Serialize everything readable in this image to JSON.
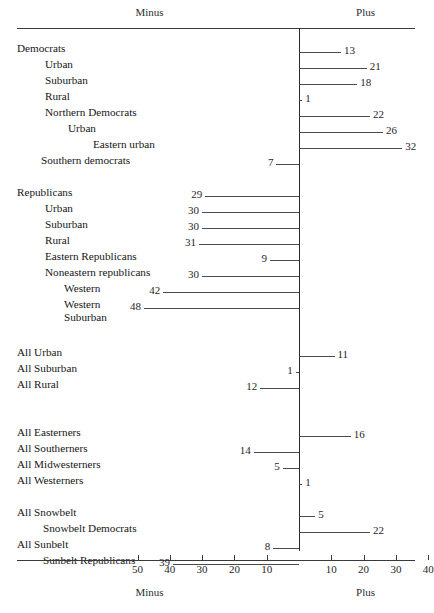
{
  "header": {
    "minus": "Minus",
    "plus": "Plus"
  },
  "footer": {
    "minus": "Minus",
    "plus": "Plus"
  },
  "axis": {
    "zero_px": 299,
    "px_per_unit": 3.23,
    "row_top": 42,
    "row_step": 16,
    "ticks_left": [
      "50",
      "40",
      "30",
      "20",
      "10"
    ],
    "ticks_right": [
      "10",
      "20",
      "30",
      "40"
    ],
    "tick_values_left": [
      50,
      40,
      30,
      20,
      10
    ],
    "tick_values_right": [
      10,
      20,
      30,
      40
    ]
  },
  "chart_data": {
    "type": "bar",
    "orientation": "horizontal-diverging",
    "title": "",
    "xlabel": "Minus / Plus",
    "ylabel": "",
    "xlim": [
      -55,
      45
    ],
    "grid": false,
    "legend": "none",
    "axis_top_label_left": "Minus",
    "axis_top_label_right": "Plus",
    "axis_bottom_label_left": "Minus",
    "axis_bottom_label_right": "Plus",
    "tick_labels": [
      "50",
      "40",
      "30",
      "20",
      "10",
      "10",
      "20",
      "30",
      "40"
    ],
    "categories": [
      "Democrats",
      "Urban",
      "Suburban",
      "Rural",
      "Northern Democrats",
      "Urban",
      "Eastern urban",
      "Southern democrats",
      "Republicans",
      "Urban",
      "Suburban",
      "Rural",
      "Eastern Republicans",
      "Noneastern republicans",
      "Western",
      "Western Suburban",
      "All Urban",
      "All Suburban",
      "All Rural",
      "All Easterners",
      "All Southerners",
      "All Midwesterners",
      "All Westerners",
      "All Snowbelt",
      "Snowbelt Democrats",
      "All Sunbelt",
      "Sunbelt Republicans"
    ],
    "values": [
      13,
      21,
      18,
      1,
      22,
      26,
      32,
      -7,
      -29,
      -30,
      -30,
      -31,
      -9,
      -30,
      -42,
      -48,
      11,
      -1,
      -12,
      16,
      -14,
      -5,
      1,
      5,
      22,
      -8,
      -39
    ]
  },
  "rows": [
    {
      "label": "Democrats",
      "indent": 17,
      "value": 13,
      "display": "13",
      "slot": 0
    },
    {
      "label": "Urban",
      "indent": 45,
      "value": 21,
      "display": "21",
      "slot": 1
    },
    {
      "label": "Suburban",
      "indent": 45,
      "value": 18,
      "display": "18",
      "slot": 2
    },
    {
      "label": "Rural",
      "indent": 45,
      "value": 1,
      "display": "1",
      "slot": 3
    },
    {
      "label": "Northern Democrats",
      "indent": 45,
      "value": 22,
      "display": "22",
      "slot": 4
    },
    {
      "label": "Urban",
      "indent": 68,
      "value": 26,
      "display": "26",
      "slot": 5
    },
    {
      "label": "Eastern urban",
      "indent": 93,
      "value": 32,
      "display": "32",
      "slot": 6
    },
    {
      "label": "Southern democrats",
      "indent": 41,
      "value": -7,
      "display": "7",
      "slot": 7
    },
    {
      "label": "Republicans",
      "indent": 17,
      "value": -29,
      "display": "29",
      "slot": 9
    },
    {
      "label": "Urban",
      "indent": 45,
      "value": -30,
      "display": "30",
      "slot": 10
    },
    {
      "label": "Suburban",
      "indent": 45,
      "value": -30,
      "display": "30",
      "slot": 11
    },
    {
      "label": "Rural",
      "indent": 45,
      "value": -31,
      "display": "31",
      "slot": 12
    },
    {
      "label": "Eastern Republicans",
      "indent": 45,
      "value": -9,
      "display": "9",
      "slot": 13
    },
    {
      "label": "Noneastern republicans",
      "indent": 45,
      "value": -30,
      "display": "30",
      "slot": 14
    },
    {
      "label": "Western",
      "indent": 64,
      "value": -42,
      "display": "42",
      "slot": 15
    },
    {
      "label": "Western\nSuburban",
      "indent": 64,
      "value": -48,
      "display": "48",
      "slot": 16
    },
    {
      "label": "All Urban",
      "indent": 17,
      "value": 11,
      "display": "11",
      "slot": 19
    },
    {
      "label": "All Suburban",
      "indent": 17,
      "value": -1,
      "display": "1",
      "slot": 20
    },
    {
      "label": "All Rural",
      "indent": 17,
      "value": -12,
      "display": "12",
      "slot": 21
    },
    {
      "label": "All Easterners",
      "indent": 17,
      "value": 16,
      "display": "16",
      "slot": 24
    },
    {
      "label": "All Southerners",
      "indent": 17,
      "value": -14,
      "display": "14",
      "slot": 25
    },
    {
      "label": "All Midwesterners",
      "indent": 17,
      "value": -5,
      "display": "5",
      "slot": 26
    },
    {
      "label": "All Westerners",
      "indent": 17,
      "value": 1,
      "display": "1",
      "slot": 27
    },
    {
      "label": "All Snowbelt",
      "indent": 17,
      "value": 5,
      "display": "5",
      "slot": 29
    },
    {
      "label": "Snowbelt Democrats",
      "indent": 43,
      "value": 22,
      "display": "22",
      "slot": 30
    },
    {
      "label": "All Sunbelt",
      "indent": 17,
      "value": -8,
      "display": "8",
      "slot": 31
    },
    {
      "label": "Sunbelt Republicans",
      "indent": 43,
      "value": -39,
      "display": "39",
      "slot": 32
    }
  ]
}
